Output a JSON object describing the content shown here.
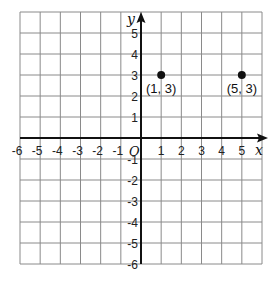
{
  "chart_data": {
    "type": "scatter",
    "title": "",
    "xlabel": "x",
    "ylabel": "y",
    "origin_label": "O",
    "xlim": [
      -6,
      6
    ],
    "ylim": [
      -6,
      6
    ],
    "grid": true,
    "x_ticks": [
      -6,
      -5,
      -4,
      -3,
      -2,
      -1,
      1,
      2,
      3,
      4,
      5
    ],
    "y_ticks": [
      5,
      4,
      3,
      2,
      1,
      -1,
      -2,
      -3,
      -4,
      -5,
      -6
    ],
    "points": [
      {
        "x": 1,
        "y": 3,
        "label": "(1, 3)"
      },
      {
        "x": 5,
        "y": 3,
        "label": "(5, 3)"
      }
    ]
  },
  "colors": {
    "grid": "#8a8a8a",
    "axis": "#111111",
    "point": "#111111"
  }
}
